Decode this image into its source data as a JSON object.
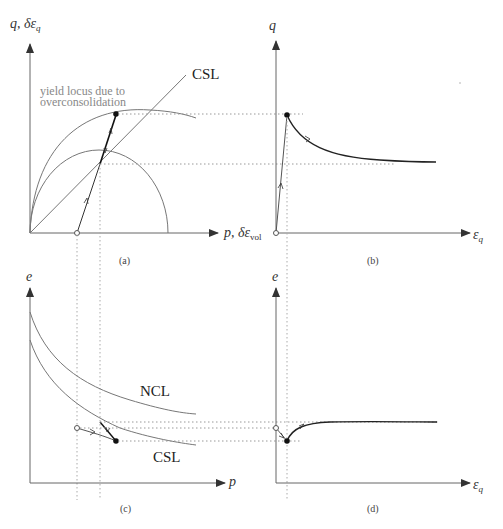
{
  "figure": {
    "panels": [
      {
        "id": "a",
        "caption": "(a)",
        "y_axis_label": "q, δε",
        "y_axis_sub": "q",
        "x_axis_label": "p, δε",
        "x_axis_sub": "vol",
        "annotations": {
          "csl": "CSL",
          "yield_line1": "yield locus due to",
          "yield_line2": "overconsolidation"
        }
      },
      {
        "id": "b",
        "caption": "(b)",
        "y_axis_label": "q",
        "x_axis_label": "ε",
        "x_axis_sub": "q"
      },
      {
        "id": "c",
        "caption": "(c)",
        "y_axis_label": "e",
        "x_axis_label": "p",
        "annotations": {
          "ncl": "NCL",
          "csl": "CSL"
        }
      },
      {
        "id": "d",
        "caption": "(d)",
        "y_axis_label": "e",
        "x_axis_label": "ε",
        "x_axis_sub": "q"
      }
    ],
    "colors": {
      "axis": "#666666",
      "curve": "#777777",
      "path": "#222222",
      "dotted": "#999999",
      "annotation_gray": "#888888"
    }
  }
}
